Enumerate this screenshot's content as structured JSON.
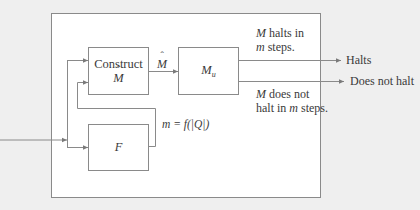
{
  "diagram": {
    "outer_box": {
      "label": ""
    },
    "boxes": {
      "construct": {
        "line1": "Construct",
        "line2": "M"
      },
      "machine_u": {
        "symbol": "M",
        "subscript": "u"
      },
      "f": {
        "symbol": "F"
      }
    },
    "edge_labels": {
      "m_hat": "M",
      "m_formula": "m = f(|Q|)",
      "halts_condition_line1_var": "M",
      "halts_condition_line1_rest": " halts in",
      "halts_condition_line2_var": "m",
      "halts_condition_line2_rest": " steps.",
      "nohalt_condition_line1_var": "M",
      "nohalt_condition_line1_rest": " does not",
      "nohalt_condition_line2_pre": "halt in ",
      "nohalt_condition_line2_var": "m",
      "nohalt_condition_line2_rest": " steps."
    },
    "outputs": {
      "halts": "Halts",
      "does_not_halt": "Does not halt"
    },
    "colors": {
      "background": "#efefef",
      "panel": "#ffffff",
      "stroke": "#8a8a8a",
      "text": "#3a3a3a"
    }
  }
}
